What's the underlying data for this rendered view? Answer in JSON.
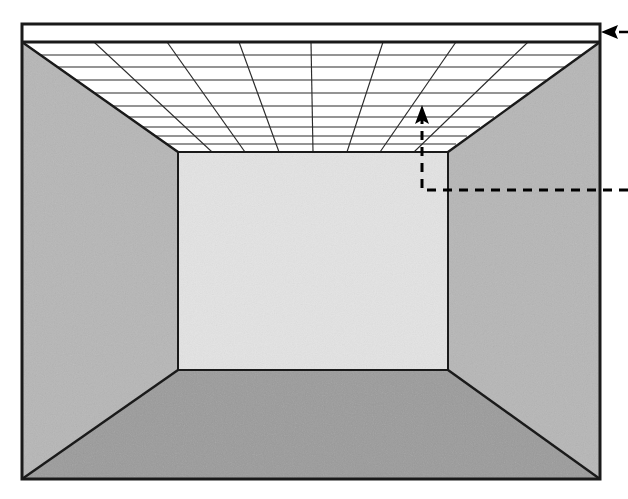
{
  "figure": {
    "caption": "",
    "background_color": "#ffffff"
  },
  "canvas": {
    "width": 628,
    "height": 499
  },
  "colors": {
    "outline": "#1a1a1a",
    "ceiling_fill": "#ffffff",
    "ceiling_grid_line": "#2b2b2b",
    "back_wall": "#e3e3e3",
    "left_wall": "#b6b6b6",
    "right_wall": "#b6b6b6",
    "floor": "#9b9b9b",
    "annotation": "#000000"
  },
  "geometry": {
    "frame": {
      "left": 22,
      "top": 24,
      "right": 600,
      "bottom": 479,
      "stroke_width": 3
    },
    "back_wall": {
      "left": 178,
      "top": 152,
      "right": 448,
      "bottom": 370
    },
    "ceiling_front_edge_y": 42,
    "ceiling_columns": 8,
    "ceiling_rows": 8
  },
  "annotations": {
    "ceiling_pointer": {
      "name": "ceiling-callout",
      "label": "",
      "arrow_direction": "left",
      "line_style": "solid",
      "start_x": 600,
      "end_x": 628,
      "y": 32
    },
    "grid_height_pointer": {
      "name": "suspended-ceiling-callout",
      "label": "",
      "arrow_direction": "up",
      "line_style": "dashed",
      "vertical_x": 422,
      "arrow_tip_y": 108,
      "corner_y": 190,
      "horizontal_end_x": 628
    }
  },
  "legend": {
    "items": []
  }
}
